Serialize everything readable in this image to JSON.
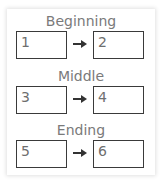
{
  "sections": [
    {
      "title": "Beginning",
      "left_box": "1",
      "right_box": "2"
    },
    {
      "title": "Middle",
      "left_box": "3",
      "right_box": "4"
    },
    {
      "title": "Ending",
      "left_box": "5",
      "right_box": "6"
    }
  ],
  "icons": {
    "connector": "arrow-right-icon"
  },
  "colors": {
    "heading": "#7a7a7a",
    "box_border": "#3a3a3a",
    "number": "#6e6e6e"
  }
}
